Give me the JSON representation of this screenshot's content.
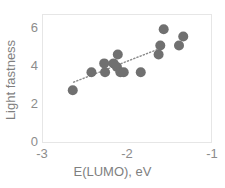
{
  "chart_data": {
    "type": "scatter",
    "title": "",
    "xlabel": "E(LUMO), eV",
    "ylabel": "Light fastness",
    "xlim": [
      -3,
      -1
    ],
    "ylim": [
      0,
      7.2
    ],
    "xticks": [
      -3,
      -2,
      -1
    ],
    "xtick_labels": [
      "-3",
      "-2",
      "-1"
    ],
    "yticks": [
      0,
      2,
      4,
      6
    ],
    "ytick_labels": [
      "0",
      "2",
      "4",
      "6"
    ],
    "grid": false,
    "legend": false,
    "marker_color": "#707070",
    "trendline_color": "#8c8c8c",
    "frame_color": "#e6e6e6",
    "series": [
      {
        "name": "Light fastness vs E(LUMO)",
        "points": [
          {
            "x": -2.65,
            "y": 3.0
          },
          {
            "x": -2.43,
            "y": 4.0
          },
          {
            "x": -2.27,
            "y": 4.0
          },
          {
            "x": -2.28,
            "y": 4.5
          },
          {
            "x": -2.17,
            "y": 4.5
          },
          {
            "x": -2.13,
            "y": 4.3
          },
          {
            "x": -2.12,
            "y": 5.0
          },
          {
            "x": -2.09,
            "y": 4.0
          },
          {
            "x": -2.05,
            "y": 4.0
          },
          {
            "x": -1.85,
            "y": 4.0
          },
          {
            "x": -1.64,
            "y": 5.0
          },
          {
            "x": -1.62,
            "y": 5.5
          },
          {
            "x": -1.58,
            "y": 6.4
          },
          {
            "x": -1.4,
            "y": 5.5
          },
          {
            "x": -1.35,
            "y": 6.0
          }
        ]
      }
    ],
    "trendline": {
      "style": "dotted",
      "x0": -2.64,
      "y0": 3.45,
      "x1": -1.56,
      "y1": 5.45
    }
  }
}
